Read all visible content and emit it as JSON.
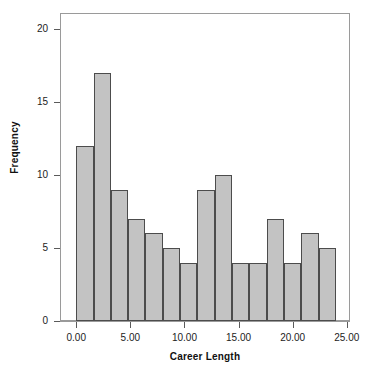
{
  "chart_data": {
    "type": "bar",
    "title": "",
    "subtitle": "",
    "xlabel": "Career Length",
    "ylabel": "Frequency",
    "grid": false,
    "legend": "none",
    "bin_width": 1.6,
    "bin_starts": [
      0,
      1.6,
      3.2,
      4.8,
      6.4,
      8.0,
      9.6,
      11.2,
      12.8,
      14.4,
      16.0,
      17.6,
      19.2,
      20.8,
      22.4
    ],
    "bin_ends": [
      1.6,
      3.2,
      4.8,
      6.4,
      8.0,
      9.6,
      11.2,
      12.8,
      14.4,
      16.0,
      17.6,
      19.2,
      20.8,
      22.4,
      24.0
    ],
    "categories": [
      "0.0-1.6",
      "1.6-3.2",
      "3.2-4.8",
      "4.8-6.4",
      "6.4-8.0",
      "8.0-9.6",
      "9.6-11.2",
      "11.2-12.8",
      "12.8-14.4",
      "14.4-16.0",
      "16.0-17.6",
      "17.6-19.2",
      "19.2-20.8",
      "20.8-22.4",
      "22.4-24.0"
    ],
    "values": [
      12,
      17,
      9,
      7,
      6,
      5,
      4,
      9,
      10,
      4,
      4,
      7,
      4,
      6,
      5
    ],
    "xlim": [
      -1.5,
      25.3
    ],
    "ylim": [
      0,
      21.1
    ],
    "xticks": [
      0,
      5,
      10,
      15,
      20,
      25
    ],
    "xticklabels": [
      "0.00",
      "5.00",
      "10.00",
      "15.00",
      "20.00",
      "25.00"
    ],
    "yticks": [
      0,
      5,
      10,
      15,
      20
    ],
    "yticklabels": [
      "0",
      "5",
      "10",
      "15",
      "20"
    ],
    "bar_fill_color": "#c3c3c3",
    "bar_edge_color": "#4c4c4c",
    "axis_color": "#9a9a9a",
    "text_color": "#1c1c1c"
  }
}
